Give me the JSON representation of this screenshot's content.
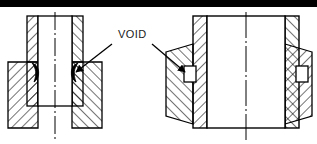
{
  "figure": {
    "background_color": "#ffffff",
    "line_color": "#000000",
    "hatch_color": "#000000",
    "width": 317,
    "height": 144
  },
  "top_border": {
    "name": "top-black-bar",
    "color": "#000000",
    "x": 0,
    "y": 0,
    "width": 317,
    "height": 7
  },
  "annotation": {
    "label": "VOID",
    "label_x": 118,
    "label_y": 38,
    "color": "#1a1a1a",
    "leaders": [
      {
        "name": "leader-left",
        "from_x": 112,
        "from_y": 44,
        "to_x": 74,
        "to_y": 73,
        "arrow": "arrowhead-left"
      },
      {
        "name": "leader-right",
        "from_x": 152,
        "from_y": 44,
        "to_x": 186,
        "to_y": 73,
        "arrow": "arrowhead-right"
      }
    ]
  },
  "left_figure": {
    "name": "left-cross-section",
    "description": "Vertical tube neck on a wider rectangular base, sectioned and hatched, with crescent shrinkage voids at the fillet corners",
    "base": {
      "x": 8,
      "y": 62,
      "width": 94,
      "height": 66
    },
    "neck": {
      "x": 27,
      "y": 16,
      "width": 56,
      "height": 46
    },
    "bore": {
      "x": 38,
      "y": 16,
      "width": 34,
      "height": 90
    },
    "centerline": {
      "x": 55,
      "y_top": 12,
      "y_bottom": 140
    },
    "voids": [
      {
        "name": "void-left-inner-left",
        "cx": 37,
        "cy": 72,
        "rx": 5,
        "ry": 9
      },
      {
        "name": "void-left-inner-right",
        "cx": 73,
        "cy": 72,
        "rx": 5,
        "ry": 9
      }
    ]
  },
  "right_figure": {
    "name": "right-cross-section",
    "description": "Hollow cylinder wall pair with trapezoidal outer flange collars and rectangular voids at the flange-to-wall interface",
    "wall_left": {
      "x": 193,
      "y": 16,
      "width": 14,
      "height": 112
    },
    "wall_right": {
      "x": 285,
      "y": 16,
      "width": 14,
      "height": 112
    },
    "bore": {
      "x": 207,
      "y": 16,
      "width": 78,
      "height": 112
    },
    "centerline": {
      "x": 246,
      "y_top": 12,
      "y_bottom": 140
    },
    "flange_left": {
      "x_outer": 166,
      "x_inner": 193,
      "y_top": 44,
      "y_bottom": 124,
      "inset": 8
    },
    "flange_right": {
      "x_outer": 312,
      "x_inner": 299,
      "y_top": 44,
      "y_bottom": 124,
      "inset": 8
    },
    "voids": [
      {
        "name": "void-right-flange-left",
        "x": 184,
        "y": 66,
        "width": 12,
        "height": 16
      },
      {
        "name": "void-right-flange-right",
        "x": 296,
        "y": 66,
        "width": 12,
        "height": 16
      }
    ]
  }
}
